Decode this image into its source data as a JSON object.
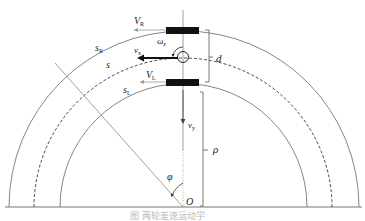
{
  "figure": {
    "type": "two-wheel robot turning kinematics on circular arc",
    "labels": {
      "v_r": "V",
      "v_r_sub": "R",
      "v_l": "V",
      "v_l_sub": "L",
      "s_r": "s",
      "s_r_sub": "R",
      "s": "s",
      "s_l": "s",
      "s_l_sub": "L",
      "v_x": "v",
      "v_x_sub": "x",
      "v_y": "v",
      "v_y_sub": "y",
      "omega": "ω",
      "omega_sub": "z",
      "d": "d",
      "rho": "ρ",
      "phi": "φ",
      "origin": "O"
    },
    "caption": "图      两轮差速运动学"
  },
  "colors": {
    "line": "#777777",
    "dark": "#111111",
    "background": "#ffffff"
  }
}
